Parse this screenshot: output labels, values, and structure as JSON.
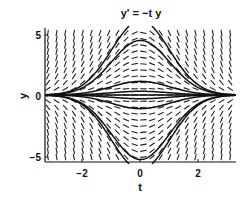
{
  "chart_data": {
    "type": "line",
    "subtype": "slope-field",
    "title": "y' = −t y",
    "xlabel": "t",
    "ylabel": "y",
    "xlim": [
      -3.3,
      3.3
    ],
    "ylim": [
      -5.4,
      5.4
    ],
    "xticks": [
      -2,
      0,
      2
    ],
    "xtick_labels": [
      "−2",
      "0",
      "2"
    ],
    "yticks": [
      -5,
      0,
      5
    ],
    "ytick_labels": [
      "−5",
      "0",
      "5"
    ],
    "grid": false,
    "legend": null,
    "ode": "dy/dt = -t*y",
    "slope_field": {
      "t_values": [
        -3.2,
        -2.9,
        -2.6,
        -2.3,
        -2.0,
        -1.7,
        -1.4,
        -1.1,
        -0.8,
        -0.5,
        -0.2,
        0.1,
        0.4,
        0.7,
        1.0,
        1.3,
        1.6,
        1.9,
        2.2,
        2.5,
        2.8,
        3.1
      ],
      "y_values": [
        -5.0,
        -4.5,
        -4.0,
        -3.5,
        -3.0,
        -2.5,
        -2.0,
        -1.5,
        -1.0,
        -0.5,
        0.0,
        0.5,
        1.0,
        1.5,
        2.0,
        2.5,
        3.0,
        3.5,
        4.0,
        4.5,
        5.0
      ]
    },
    "series": [
      {
        "name": "solution y0=6",
        "y0": 6
      },
      {
        "name": "solution y0=4.4",
        "y0": 4.4
      },
      {
        "name": "solution y0=1.1",
        "y0": 1.1
      },
      {
        "name": "solution y0=0.3",
        "y0": 0.3
      },
      {
        "name": "solution y0=0",
        "y0": 0
      },
      {
        "name": "solution y0=-0.3",
        "y0": -0.3
      },
      {
        "name": "solution y0=-1.1",
        "y0": -1.1
      },
      {
        "name": "solution y0=-5.2",
        "y0": -5.2
      },
      {
        "name": "solution y0=-6",
        "y0": -6
      }
    ]
  },
  "plot": {
    "title": "y' = −t y",
    "xlabel": "t",
    "ylabel": "y",
    "xtick_labels": [
      "−2",
      "0",
      "2"
    ],
    "ytick_labels": [
      "5",
      "0",
      "−5"
    ]
  }
}
